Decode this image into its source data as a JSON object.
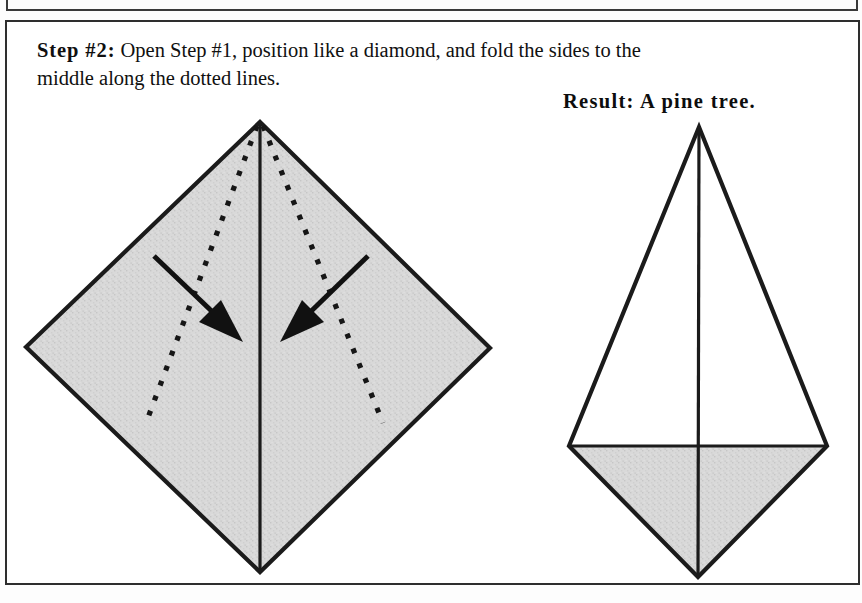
{
  "page": {
    "background_color": "#ffffff",
    "border_color": "#2e2e2e"
  },
  "instruction": {
    "step_label": "Step #2:",
    "step_body": " Open Step #1, position like a diamond, and fold the sides to the middle along the dotted lines.",
    "full_text": "Step #2: Open Step #1, position like a diamond, and fold the sides to the middle along the dotted lines."
  },
  "result": {
    "label": "Result:  A pine tree."
  },
  "diagram": {
    "paper_fill_color": "#d7d7d7",
    "line_color": "#1b1b1b",
    "left_figure": {
      "name": "diamond-with-fold-lines",
      "shape": "diamond",
      "vertices": {
        "top": [
          260,
          122
        ],
        "right": [
          490,
          348
        ],
        "bottom": [
          260,
          572
        ],
        "left": [
          26,
          347
        ]
      },
      "center_crease": {
        "from": [
          260,
          122
        ],
        "to": [
          260,
          572
        ]
      },
      "fold_lines": [
        {
          "name": "left-dotted-fold",
          "from": [
            258,
            124
          ],
          "to": [
            146,
            423
          ]
        },
        {
          "name": "right-dotted-fold",
          "from": [
            262,
            124
          ],
          "to": [
            383,
            423
          ]
        }
      ],
      "arrows": [
        {
          "name": "left-fold-arrow",
          "from": [
            154,
            256
          ],
          "to": [
            240,
            339
          ],
          "direction": "down-right"
        },
        {
          "name": "right-fold-arrow",
          "from": [
            368,
            256
          ],
          "to": [
            283,
            339
          ],
          "direction": "down-left"
        }
      ]
    },
    "right_figure": {
      "name": "pine-tree-result",
      "shape": "kite",
      "vertices": {
        "top": [
          699,
          127
        ],
        "right": [
          827,
          446
        ],
        "bottom": [
          698,
          577
        ],
        "left": [
          569,
          446
        ]
      },
      "center_crease": {
        "from": [
          699,
          127
        ],
        "to": [
          698,
          577
        ]
      },
      "horizontal_crease": {
        "from": [
          569,
          446
        ],
        "to": [
          827,
          446
        ]
      },
      "upper_triangle_fill": "#ffffff",
      "lower_triangle_fill": "#d7d7d7"
    }
  }
}
